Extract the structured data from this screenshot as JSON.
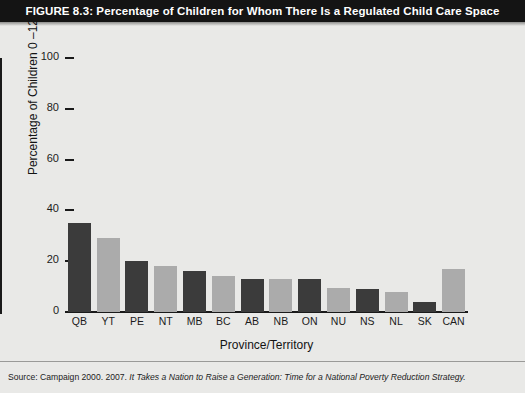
{
  "figure": {
    "title": "FIGURE 8.3: Percentage of Children for Whom There Is a Regulated Child Care Space",
    "source_prefix": "Source: Campaign 2000. 2007. ",
    "source_italic": "It Takes a Nation to Raise a Generation: Time for a National Poverty Reduction Strategy."
  },
  "colors": {
    "banner_bg": "#141414",
    "banner_text": "#ffffff",
    "page_bg": "#e9e9e7",
    "bar_dark": "#3b3b3b",
    "bar_light": "#ababab",
    "axis": "#1a1a1a"
  },
  "chart_data": {
    "type": "bar",
    "title": "FIGURE 8.3: Percentage of Children for Whom There Is a Regulated Child Care Space",
    "xlabel": "Province/Territory",
    "ylabel": "Percentage of Children 0 –12",
    "categories": [
      "QB",
      "YT",
      "PE",
      "NT",
      "MB",
      "BC",
      "AB",
      "NB",
      "ON",
      "NU",
      "NS",
      "NL",
      "SK",
      "CAN"
    ],
    "values": [
      35,
      29,
      20,
      18,
      16,
      14,
      13,
      13,
      13,
      9.5,
      9,
      8,
      4,
      17
    ],
    "bar_colors": [
      "dark",
      "light",
      "dark",
      "light",
      "dark",
      "light",
      "dark",
      "light",
      "dark",
      "light",
      "dark",
      "light",
      "dark",
      "light"
    ],
    "ylim": [
      0,
      100
    ],
    "yticks": [
      0,
      20,
      40,
      60,
      80,
      100
    ],
    "ytick_labels": [
      "0",
      "20",
      "40",
      "60",
      "80",
      "100"
    ],
    "grid": false,
    "legend": "none"
  }
}
